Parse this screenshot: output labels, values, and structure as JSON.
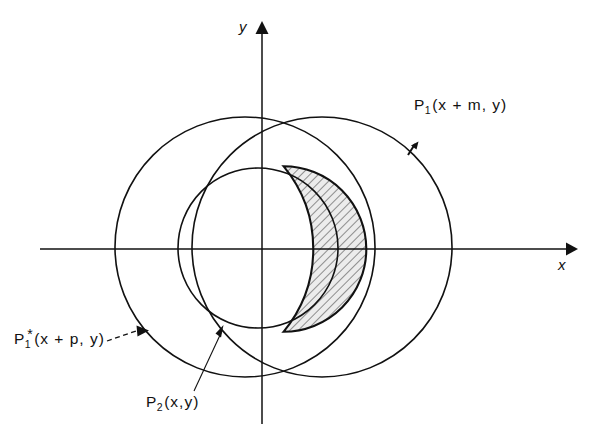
{
  "figure": {
    "background_color": "#ffffff",
    "stroke_color": "#111111",
    "shade_fill": "#e8e8e8",
    "hatch_color": "#3a3a3a"
  },
  "axes": {
    "x_label": "x",
    "y_label": "y",
    "origin": {
      "x": 262,
      "y": 249
    },
    "x_axis": {
      "x_start": 40,
      "x_end": 578,
      "y": 249,
      "arrow": "right"
    },
    "y_axis": {
      "x": 262,
      "y_start": 22,
      "y_end": 424,
      "arrow": "up"
    }
  },
  "curves": [
    {
      "name": "P1-star-circle",
      "label": "P₁* (x + p, y)",
      "label_parts": {
        "base": "P",
        "sub": "1",
        "star": "*",
        "args": "(x + p, y)"
      },
      "center_x": 245,
      "center_y": 247,
      "radius": 130,
      "pointer": "dashed-arrow"
    },
    {
      "name": "P2-circle",
      "label": "P₂ (x, y)",
      "label_parts": {
        "base": "P",
        "sub": "2",
        "star": "",
        "args": "(x,y)"
      },
      "center_x": 258,
      "center_y": 248,
      "radius": 80,
      "pointer": "solid-arrow"
    },
    {
      "name": "P1-circle",
      "label": "P₁ (x + m, y)",
      "label_parts": {
        "base": "P",
        "sub": "1",
        "star": "",
        "args": "(x + m, y)"
      },
      "center_x": 322,
      "center_y": 247,
      "radius": 130,
      "pointer": "tick-mark"
    }
  ],
  "shaded_region": {
    "name": "intersection-lens",
    "description": "hatched lens-shaped overlap of P2 and P1 circles",
    "left_x": 237,
    "right_x": 337,
    "top_y": 166,
    "bottom_y": 332,
    "hatch_angle_deg": 45
  }
}
